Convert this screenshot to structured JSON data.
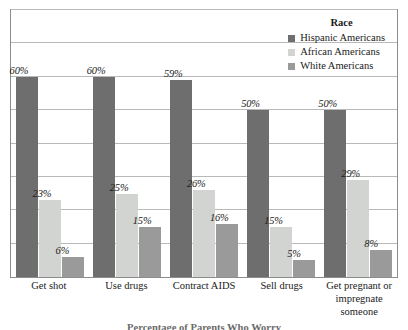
{
  "chart_data": {
    "type": "bar",
    "title": "",
    "xlabel": "",
    "ylabel": "",
    "ylim": [
      0,
      80
    ],
    "grid": true,
    "gridline_values": [
      10,
      20,
      30,
      40,
      50,
      60,
      70,
      80
    ],
    "legend_position": "top-right inside plot area",
    "legend_title": "Race",
    "categories": [
      "Get shot",
      "Use drugs",
      "Contract AIDS",
      "Sell drugs",
      "Get pregnant or impregnate someone"
    ],
    "series": [
      {
        "name": "Hispanic Americans",
        "color": "#6e6e6e",
        "values": [
          60,
          60,
          59,
          50,
          50
        ],
        "labels": [
          "60%",
          "60%",
          "59%",
          "50%",
          "50%"
        ]
      },
      {
        "name": "African Americans",
        "color": "#d2d4d2",
        "values": [
          23,
          25,
          26,
          15,
          29
        ],
        "labels": [
          "23%",
          "25%",
          "26%",
          "15%",
          "29%"
        ]
      },
      {
        "name": "White Americans",
        "color": "#9a9a9a",
        "values": [
          6,
          15,
          16,
          5,
          8
        ],
        "labels": [
          "6%",
          "15%",
          "16%",
          "5%",
          "8%"
        ]
      }
    ]
  },
  "legend": {
    "title": "Race",
    "entries": [
      {
        "label": "Hispanic Americans",
        "color": "#6e6e6e"
      },
      {
        "label": "African Americans",
        "color": "#d2d4d2"
      },
      {
        "label": "White Americans",
        "color": "#9a9a9a"
      }
    ]
  },
  "axis": {
    "categories": [
      "Get shot",
      "Use drugs",
      "Contract AIDS",
      "Sell drugs",
      "Get pregnant or impregnate someone"
    ]
  },
  "caption": {
    "text": "Percentage of Parents Who Worry"
  },
  "colors": {
    "frame": "#8c8c8c",
    "gridline": "#b9b9b9",
    "background": "#ffffff",
    "text": "#1a1a1a"
  }
}
